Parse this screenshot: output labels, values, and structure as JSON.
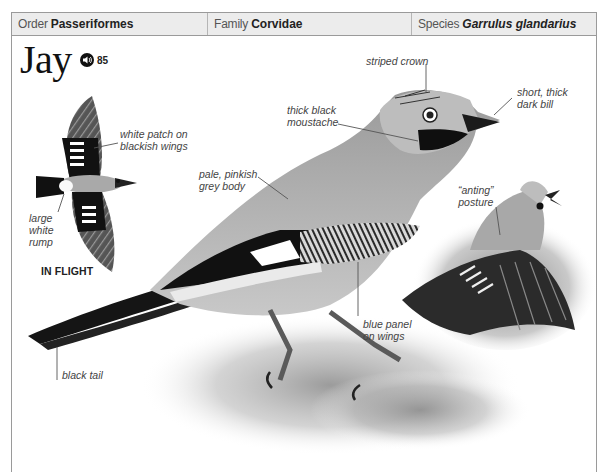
{
  "taxonomy": {
    "order": {
      "label": "Order",
      "value": "Passeriformes"
    },
    "family": {
      "label": "Family",
      "value": "Corvidae"
    },
    "species": {
      "label": "Species",
      "value": "Garrulus glandarius"
    }
  },
  "species_entry": {
    "common_name": "Jay",
    "audio": {
      "icon": "speaker-icon",
      "track_number": "85"
    }
  },
  "illustrations": {
    "in_flight": {
      "caption": "IN FLIGHT",
      "annotations": {
        "white_patch": [
          "white patch on",
          "blackish wings"
        ],
        "rump": [
          "large",
          "white",
          "rump"
        ]
      }
    },
    "perched": {
      "annotations": {
        "crown": "striped crown",
        "bill": [
          "short, thick",
          "dark bill"
        ],
        "moustache": [
          "thick black",
          "moustache"
        ],
        "body": [
          "pale, pinkish",
          "grey body"
        ],
        "wing_panel": [
          "blue panel",
          "on wings"
        ],
        "tail": "black tail"
      }
    },
    "anting": {
      "annotations": {
        "posture": [
          "“anting”",
          "posture"
        ]
      }
    }
  },
  "colors": {
    "header_bg": "#ececec",
    "border": "#9a9a9a",
    "text": "#222222",
    "label_text": "#444444"
  }
}
